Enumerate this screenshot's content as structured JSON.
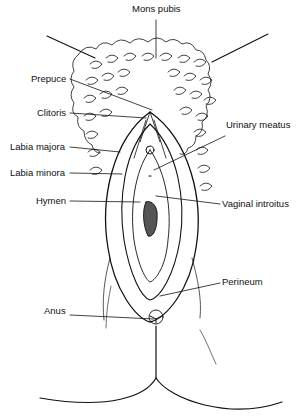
{
  "diagram": {
    "style": "black-and-white anatomical line illustration",
    "line_color": "#111111",
    "background": "#ffffff",
    "labels": {
      "mons_pubis": "Mons pubis",
      "prepuce": "Prepuce",
      "clitoris": "Clitoris",
      "urinary_meatus": "Urinary meatus",
      "labia_majora": "Labia majora",
      "labia_minora": "Labia minora",
      "hymen": "Hymen",
      "vaginal_introitus": "Vaginal introitus",
      "perineum": "Perineum",
      "anus": "Anus"
    }
  }
}
